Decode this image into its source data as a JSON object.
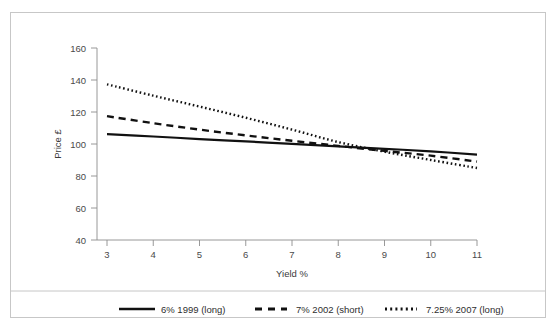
{
  "chart_data": {
    "type": "line",
    "title": "",
    "subtitle": "",
    "xlabel": "Yield %",
    "ylabel": "Price £",
    "xlim": [
      3,
      11
    ],
    "ylim": [
      40,
      160
    ],
    "xticks": [
      3,
      4,
      5,
      6,
      7,
      8,
      9,
      10,
      11
    ],
    "yticks": [
      40,
      60,
      80,
      100,
      120,
      140,
      160
    ],
    "xtick_labels": [
      "3",
      "4",
      "5",
      "6",
      "7",
      "8",
      "9",
      "10",
      "11"
    ],
    "ytick_labels": [
      "40",
      "60",
      "80",
      "100",
      "120",
      "140",
      "160"
    ],
    "grid": false,
    "legend_position": "bottom",
    "x": [
      3,
      4,
      5,
      6,
      7,
      8,
      9,
      10,
      11
    ],
    "series": [
      {
        "name": "6% 1999 (long)",
        "style": "solid",
        "color": "#111111",
        "values": [
          106.2,
          104.7,
          103.1,
          101.6,
          100.1,
          98.5,
          97.0,
          95.4,
          93.4
        ]
      },
      {
        "name": "7% 2002 (short)",
        "style": "dashed",
        "color": "#111111",
        "values": [
          117.4,
          113.0,
          109.0,
          105.4,
          102.0,
          98.8,
          95.7,
          92.7,
          89.0
        ]
      },
      {
        "name": "7.25% 2007 (long)",
        "style": "dotted",
        "color": "#111111",
        "values": [
          137.3,
          130.2,
          123.4,
          116.4,
          109.0,
          101.2,
          95.2,
          90.0,
          85.0
        ]
      }
    ]
  },
  "axes": {
    "x_axis_title": "Yield %",
    "y_axis_title": "Price £"
  },
  "legend": {
    "items": [
      {
        "label": "6% 1999 (long)",
        "style": "solid"
      },
      {
        "label": "7% 2002 (short)",
        "style": "dashed"
      },
      {
        "label": "7.25% 2007 (long)",
        "style": "dotted"
      }
    ]
  },
  "colors": {
    "ink": "#111111",
    "axis": "#8d8d8d",
    "border": "#c7c7c7",
    "background": "#ffffff"
  }
}
